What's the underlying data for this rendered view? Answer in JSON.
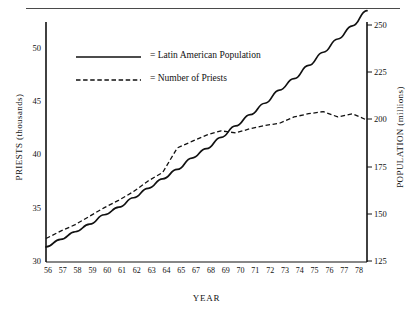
{
  "chart_data": {
    "type": "line",
    "title": "",
    "xlabel": "YEAR",
    "ylabel": "PRIESTS (thousands)",
    "y2label": "POPULATION (millions)",
    "grid": false,
    "legend_position": "upper-left-inside",
    "x": [
      1956,
      1957,
      1958,
      1959,
      1960,
      1961,
      1962,
      1963,
      1964,
      1965,
      1966,
      1967,
      1968,
      1969,
      1970,
      1971,
      1972,
      1973,
      1974,
      1975,
      1976,
      1977,
      1978
    ],
    "xtick_labels": [
      "56",
      "57",
      "58",
      "59",
      "60",
      "61",
      "62",
      "63",
      "64",
      "65",
      "67",
      "68",
      "69",
      "70",
      "71",
      "72",
      "73",
      "74",
      "75",
      "76",
      "77",
      "78"
    ],
    "xlim": [
      1956,
      1978
    ],
    "ylim": [
      30,
      52.5
    ],
    "ytick_labels": [
      "30",
      "35",
      "40",
      "45",
      "50"
    ],
    "ytick_values": [
      30,
      35,
      40,
      45,
      50
    ],
    "y2lim": [
      125,
      252
    ],
    "y2tick_labels": [
      "125",
      "150",
      "175",
      "200",
      "225",
      "250"
    ],
    "y2tick_values": [
      125,
      150,
      175,
      200,
      225,
      250
    ],
    "series": [
      {
        "name": "Latin American Population",
        "axis": "right",
        "units": "millions",
        "style": "solid",
        "color": "#111111",
        "values": [
          133,
          137,
          141,
          145,
          150,
          154,
          159,
          164,
          169,
          174,
          180,
          185,
          191,
          197,
          203,
          209,
          216,
          222,
          229,
          236,
          243,
          250,
          258
        ]
      },
      {
        "name": "Number of Priests",
        "axis": "left",
        "units": "thousands",
        "style": "dashed",
        "color": "#111111",
        "values": [
          32.2,
          32.9,
          33.5,
          34.3,
          35.1,
          35.8,
          36.6,
          37.6,
          38.4,
          40.7,
          41.3,
          41.9,
          42.3,
          42.1,
          42.5,
          42.8,
          43.0,
          43.6,
          43.9,
          44.1,
          43.6,
          43.9,
          43.3
        ]
      }
    ]
  },
  "legend": {
    "entries": [
      {
        "equals": "=",
        "label": "Latin American Population",
        "style": "solid"
      },
      {
        "equals": "=",
        "label": "Number of Priests",
        "style": "dashed"
      }
    ]
  },
  "axes": {
    "left_title": "PRIESTS (thousands)",
    "right_title": "POPULATION (millions)",
    "x_title": "YEAR"
  }
}
